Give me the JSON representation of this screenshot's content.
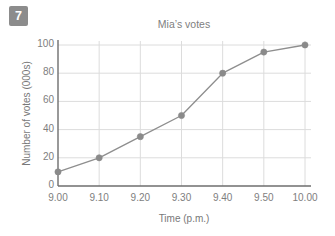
{
  "badge": {
    "number": "7"
  },
  "chart_data": {
    "type": "line",
    "title": "Mia’s votes",
    "xlabel": "Time (p.m.)",
    "ylabel": "Number of votes (000s)",
    "categories": [
      "9.00",
      "9.10",
      "9.20",
      "9.30",
      "9.40",
      "9.50",
      "10.00"
    ],
    "values": [
      10,
      20,
      35,
      50,
      80,
      95,
      100
    ],
    "x_tick_labels": [
      "9.00",
      "9.10",
      "9.20",
      "9.30",
      "9.40",
      "9.50",
      "10.00"
    ],
    "y_tick_labels": [
      "0",
      "20",
      "40",
      "60",
      "80",
      "100"
    ],
    "y_ticks": [
      0,
      20,
      40,
      60,
      80,
      100
    ],
    "ylim": [
      0,
      105
    ],
    "grid": true,
    "legend": "none",
    "series": [
      {
        "name": "Mia’s votes",
        "values": [
          10,
          20,
          35,
          50,
          80,
          95,
          100
        ],
        "color": "#8e8e8e",
        "marker": "circle"
      }
    ],
    "colors": {
      "line": "#8e8e8e",
      "marker": "#8a8a8a",
      "grid": "#dcdcdc",
      "axis": "#6e6e6e",
      "text": "#7e7e7e",
      "background": "#ffffff"
    }
  }
}
